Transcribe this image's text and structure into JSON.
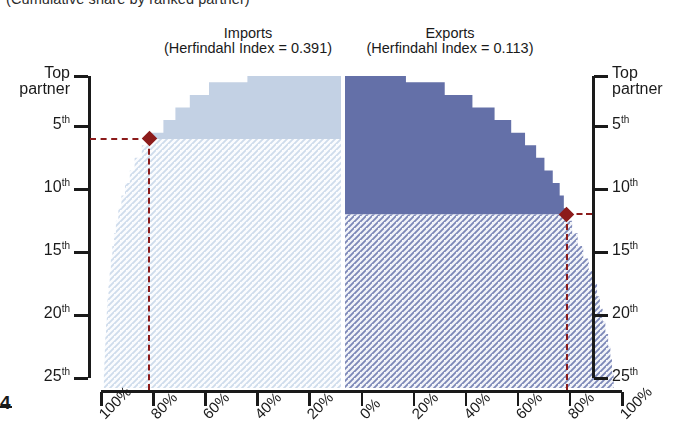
{
  "figure": {
    "clipped_caption": "(Cumulative share by ranked partner)",
    "corner_label": "4"
  },
  "panels": [
    {
      "id": "imports",
      "title": "Imports",
      "subtitle": "(Herfindahl Index = 0.391)",
      "herfindahl_index": 0.391,
      "fill_color": "#c3d1e4",
      "hatch_color": "#b9c9de",
      "marker": {
        "rank": 6,
        "cumulative_share": "80%",
        "color": "#8c1b1b"
      }
    },
    {
      "id": "exports",
      "title": "Exports",
      "subtitle": "(Herfindahl Index = 0.113)",
      "herfindahl_index": 0.113,
      "fill_color": "#6470a8",
      "hatch_color": "#6470a8",
      "marker": {
        "rank": 12,
        "cumulative_share": "80%",
        "color": "#8c1b1b"
      }
    }
  ],
  "axes": {
    "y_left": {
      "name": "partner-rank-left",
      "ticks": [
        {
          "label": "Top partner",
          "value": 1,
          "two_line": true
        },
        {
          "label": "5",
          "suffix": "th",
          "value": 5
        },
        {
          "label": "10",
          "suffix": "th",
          "value": 10
        },
        {
          "label": "15",
          "suffix": "th",
          "value": 15
        },
        {
          "label": "20",
          "suffix": "th",
          "value": 20
        },
        {
          "label": "25",
          "suffix": "th",
          "value": 25
        }
      ]
    },
    "y_right": {
      "name": "partner-rank-right",
      "ticks": [
        {
          "label": "Top partner",
          "value": 1,
          "two_line": true
        },
        {
          "label": "5",
          "suffix": "th",
          "value": 5
        },
        {
          "label": "10",
          "suffix": "th",
          "value": 10
        },
        {
          "label": "15",
          "suffix": "th",
          "value": 15
        },
        {
          "label": "20",
          "suffix": "th",
          "value": 20
        },
        {
          "label": "25",
          "suffix": "th",
          "value": 25
        }
      ]
    },
    "x": {
      "labels": [
        "100%",
        "80%",
        "60%",
        "40%",
        "20%",
        "0%",
        "20%",
        "40%",
        "60%",
        "80%",
        "100%"
      ],
      "values": [
        100,
        80,
        60,
        40,
        20,
        0,
        20,
        40,
        60,
        80,
        100
      ]
    }
  },
  "chart_data": {
    "type": "area",
    "xlabel": "Cumulative share (%)",
    "ylabel": "Partner rank",
    "orientation": "mirrored-horizontal",
    "ylim": [
      1,
      25
    ],
    "xlim": [
      0,
      100
    ],
    "grid": false,
    "legend": "none",
    "x_tick_labels": [
      "100%",
      "80%",
      "60%",
      "40%",
      "20%",
      "0%",
      "20%",
      "40%",
      "60%",
      "80%",
      "100%"
    ],
    "y_tick_labels": [
      "Top partner",
      "5th",
      "10th",
      "15th",
      "20th",
      "25th"
    ],
    "series": [
      {
        "name": "Imports",
        "side": "left",
        "color": "#c3d1e4",
        "annotation": "(Herfindahl Index = 0.391)",
        "ranks": [
          1,
          2,
          3,
          4,
          5,
          6,
          7,
          8,
          9,
          10,
          11,
          12,
          13,
          14,
          15,
          16,
          17,
          18,
          19,
          20,
          21,
          22,
          23,
          24,
          25
        ],
        "values": [
          39,
          55,
          63,
          69,
          74,
          80,
          83,
          86,
          88,
          90,
          91.5,
          92.8,
          93.8,
          94.6,
          95.3,
          95.9,
          96.4,
          96.9,
          97.3,
          97.6,
          97.9,
          98.2,
          98.4,
          98.6,
          98.8
        ]
      },
      {
        "name": "Exports",
        "side": "right",
        "color": "#6470a8",
        "annotation": "(Herfindahl Index = 0.113)",
        "ranks": [
          1,
          2,
          3,
          4,
          5,
          6,
          7,
          8,
          9,
          10,
          11,
          12,
          13,
          14,
          15,
          16,
          17,
          18,
          19,
          20,
          21,
          22,
          23,
          24,
          25
        ],
        "values": [
          22,
          36,
          46,
          54,
          60,
          65,
          69,
          72,
          75,
          77.5,
          79,
          80,
          82,
          84,
          86,
          88,
          89.5,
          91,
          92,
          93,
          94,
          95,
          95.8,
          96.4,
          97
        ]
      }
    ],
    "annotations": [
      {
        "series": "Imports",
        "text": "80% of imports reached by the 6th partner",
        "rank": 6,
        "share": 80
      },
      {
        "series": "Exports",
        "text": "80% of exports reached by the 12th partner",
        "rank": 12,
        "share": 80
      }
    ]
  }
}
